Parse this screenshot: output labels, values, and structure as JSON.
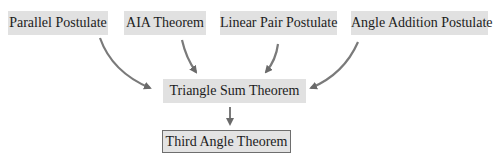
{
  "diagram": {
    "type": "flowchart",
    "colors": {
      "box_fill": "#e1e1e1",
      "box_border": "#6e6e6e",
      "arrow": "#7a7a7a",
      "text": "#1c1c1c"
    },
    "premises": [
      {
        "id": "parallel",
        "label": "Parallel Postulate"
      },
      {
        "id": "aia",
        "label": "AIA Theorem"
      },
      {
        "id": "linear",
        "label": "Linear Pair Postulate"
      },
      {
        "id": "angle_add",
        "label": "Angle Addition Postulate"
      }
    ],
    "middle": {
      "id": "triangle_sum",
      "label": "Triangle Sum Theorem"
    },
    "conclusion": {
      "id": "third_angle",
      "label": "Third Angle Theorem"
    },
    "edges": [
      {
        "from": "parallel",
        "to": "triangle_sum"
      },
      {
        "from": "aia",
        "to": "triangle_sum"
      },
      {
        "from": "linear",
        "to": "triangle_sum"
      },
      {
        "from": "angle_add",
        "to": "triangle_sum"
      },
      {
        "from": "triangle_sum",
        "to": "third_angle"
      }
    ]
  }
}
